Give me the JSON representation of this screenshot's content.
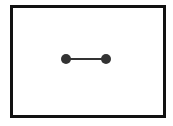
{
  "diagram": {
    "type": "graph",
    "frame": {
      "stroke": "#111111"
    },
    "nodes": [
      {
        "id": "node-left",
        "cx": 66,
        "cy": 59,
        "r": 5,
        "fill": "#333333"
      },
      {
        "id": "node-right",
        "cx": 106,
        "cy": 59,
        "r": 5,
        "fill": "#333333"
      }
    ],
    "edges": [
      {
        "from": "node-left",
        "to": "node-right",
        "stroke": "#333333",
        "width": 2
      }
    ]
  }
}
